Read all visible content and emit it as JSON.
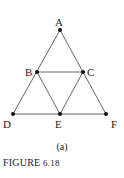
{
  "figure": {
    "caption_label": "FIGURE",
    "caption_number": "6.18",
    "sublabel": "(a)"
  },
  "diagram": {
    "line_color": "#555555",
    "point_color": "#111111",
    "points": [
      {
        "id": "A",
        "label": "A",
        "x": 60,
        "y": 30
      },
      {
        "id": "B",
        "label": "B",
        "x": 37,
        "y": 72
      },
      {
        "id": "C",
        "label": "C",
        "x": 83,
        "y": 72
      },
      {
        "id": "D",
        "label": "D",
        "x": 13,
        "y": 114
      },
      {
        "id": "E",
        "label": "E",
        "x": 60,
        "y": 114
      },
      {
        "id": "F",
        "label": "F",
        "x": 106,
        "y": 114
      }
    ],
    "edges": [
      [
        "A",
        "B"
      ],
      [
        "B",
        "D"
      ],
      [
        "A",
        "C"
      ],
      [
        "C",
        "F"
      ],
      [
        "B",
        "C"
      ],
      [
        "D",
        "E"
      ],
      [
        "E",
        "F"
      ],
      [
        "B",
        "E"
      ],
      [
        "C",
        "E"
      ]
    ]
  }
}
